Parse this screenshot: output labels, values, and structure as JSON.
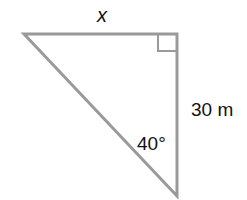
{
  "diagram": {
    "type": "right-triangle",
    "line_color": "#9a9a9a",
    "labels": {
      "top_side": "x",
      "right_side": "30 m",
      "angle": "40°"
    },
    "right_angle_at": "top-right vertex"
  }
}
